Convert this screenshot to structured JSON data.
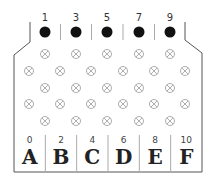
{
  "diagram": {
    "top_pins": [
      {
        "label": "1",
        "x": 45
      },
      {
        "label": "3",
        "x": 76
      },
      {
        "label": "5",
        "x": 107
      },
      {
        "label": "7",
        "x": 139
      },
      {
        "label": "9",
        "x": 170
      }
    ],
    "columns": [
      {
        "number": "0",
        "letter": "A"
      },
      {
        "number": "2",
        "letter": "B"
      },
      {
        "number": "4",
        "letter": "C"
      },
      {
        "number": "6",
        "letter": "D"
      },
      {
        "number": "8",
        "letter": "E"
      },
      {
        "number": "10",
        "letter": "F"
      }
    ],
    "crossed_circle_rows": [
      {
        "y": 54,
        "xs": [
          45,
          76,
          107,
          139,
          170
        ]
      },
      {
        "y": 71,
        "xs": [
          29,
          60,
          91,
          123,
          154,
          185
        ]
      },
      {
        "y": 88,
        "xs": [
          45,
          76,
          107,
          139,
          170
        ]
      },
      {
        "y": 104,
        "xs": [
          29,
          60,
          91,
          123,
          154,
          185
        ]
      },
      {
        "y": 121,
        "xs": [
          45,
          76,
          107,
          139,
          170
        ]
      }
    ],
    "colors": {
      "outline": "#555555",
      "pin": "#111111",
      "circle": "#999999",
      "divider": "#aaaaaa"
    }
  }
}
